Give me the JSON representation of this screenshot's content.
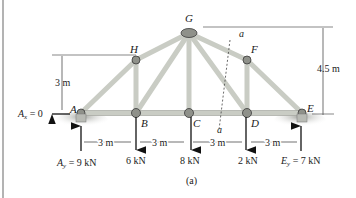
{
  "figure": {
    "caption": "(a)",
    "joints": {
      "A": "A",
      "B": "B",
      "C": "C",
      "D": "D",
      "E": "E",
      "F": "F",
      "G": "G",
      "H": "H"
    },
    "section_label_top": "a",
    "section_label_bottom": "a",
    "dimensions": {
      "height_small": "3 m",
      "height_large": "4.5 m",
      "span_1": "3 m",
      "span_2": "3 m",
      "span_3": "3 m",
      "span_4": "3 m"
    },
    "reactions": {
      "Ax_sym": "A",
      "Ax_sub": "x",
      "Ax_val": " = 0",
      "Ay_sym": "A",
      "Ay_sub": "y",
      "Ay_val": " = 9 kN",
      "Ey_sym": "E",
      "Ey_sub": "y",
      "Ey_val": " = 7 kN"
    },
    "loads": {
      "B": "6 kN",
      "C": "8 kN",
      "D": "2 kN"
    },
    "colors": {
      "member": "#c9ccc4",
      "member_edge": "#9a9c95",
      "joint": "#8f918a",
      "ground": "#b8bab4",
      "line": "#222222",
      "frame": "#9a9a9a"
    }
  }
}
